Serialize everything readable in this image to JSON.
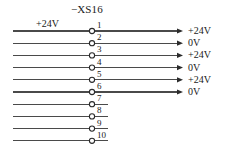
{
  "diagram": {
    "type": "terminal-block-wiring-diagram",
    "connector_designation": "−XS16",
    "source_label": "+24V",
    "background_color": "#ffffff",
    "line_color": "#4a4a4a",
    "text_color": "#1a1a1a",
    "terminal_count": 10,
    "terminals": [
      {
        "number": "1",
        "signal": "+24V",
        "has_arrow": true,
        "has_output_wire": true
      },
      {
        "number": "2",
        "signal": "0V",
        "has_arrow": true,
        "has_output_wire": true
      },
      {
        "number": "3",
        "signal": "+24V",
        "has_arrow": true,
        "has_output_wire": true
      },
      {
        "number": "4",
        "signal": "0V",
        "has_arrow": true,
        "has_output_wire": true
      },
      {
        "number": "5",
        "signal": "+24V",
        "has_arrow": true,
        "has_output_wire": true
      },
      {
        "number": "6",
        "signal": "0V",
        "has_arrow": true,
        "has_output_wire": true
      },
      {
        "number": "7",
        "signal": "",
        "has_arrow": false,
        "has_output_wire": false
      },
      {
        "number": "8",
        "signal": "",
        "has_arrow": false,
        "has_output_wire": false
      },
      {
        "number": "9",
        "signal": "",
        "has_arrow": false,
        "has_output_wire": false
      },
      {
        "number": "10",
        "signal": "",
        "has_arrow": false,
        "has_output_wire": false
      }
    ]
  }
}
